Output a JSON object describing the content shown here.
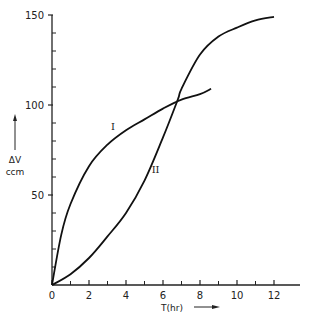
{
  "chart_data": {
    "type": "line",
    "title": "",
    "xlabel": "T(hr)",
    "ylabel": "ΔV ccm",
    "xlim": [
      0,
      13
    ],
    "ylim": [
      0,
      150
    ],
    "x_ticks": [
      0,
      2,
      4,
      6,
      8,
      10,
      12
    ],
    "x_minor_ticks": [
      1,
      3,
      5,
      7,
      9,
      11
    ],
    "y_ticks": [
      50,
      100,
      150
    ],
    "y_minor_ticks": [
      10,
      20,
      30,
      40,
      60,
      70,
      80,
      90,
      110,
      120,
      130,
      140
    ],
    "grid": false,
    "legend": "none (inline roman-numeral labels)",
    "series": [
      {
        "name": "I",
        "label_position": {
          "x": 3.3,
          "y": 86
        },
        "x": [
          0,
          0.5,
          1,
          2,
          3,
          4,
          5,
          6,
          7,
          8,
          8.6
        ],
        "values": [
          0,
          28,
          45,
          66,
          78,
          86,
          92,
          98,
          103,
          106,
          109
        ]
      },
      {
        "name": "II",
        "label_position": {
          "x": 5.6,
          "y": 62
        },
        "x": [
          0,
          1,
          2,
          3,
          4,
          5,
          6,
          6.8,
          7,
          8,
          9,
          10,
          11,
          12
        ],
        "values": [
          0,
          6,
          15,
          27,
          40,
          58,
          82,
          103,
          109,
          128,
          138,
          143,
          147,
          149
        ]
      }
    ]
  },
  "axes": {
    "y_tick_labels": [
      "50",
      "100",
      "150"
    ],
    "x_tick_labels": [
      "0",
      "2",
      "4",
      "6",
      "8",
      "10",
      "12"
    ],
    "y_label_line1": "ΔV",
    "y_label_line2": "ccm",
    "x_label": "T(hr)"
  },
  "curve_labels": {
    "I": "I",
    "II": "II"
  }
}
